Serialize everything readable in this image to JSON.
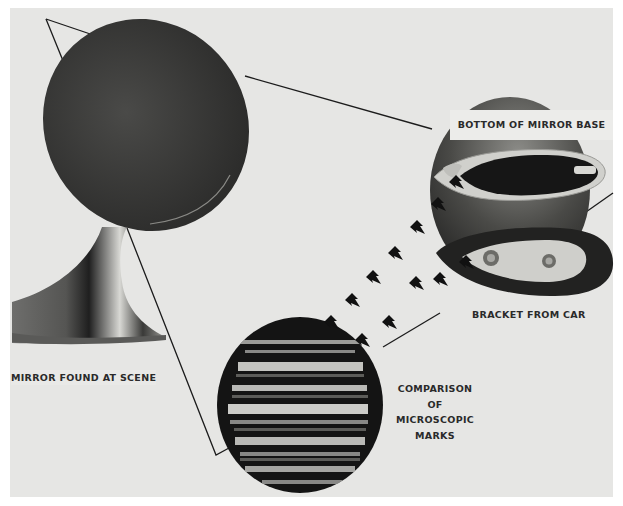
{
  "figure": {
    "background_color": "#e6e6e4",
    "ink_color": "#1c1c1c",
    "labels": {
      "bottom_of_mirror_base": "BOTTOM OF MIRROR BASE",
      "bracket_from_car": "BRACKET FROM CAR",
      "mirror_found_at_scene": "MIRROR FOUND AT SCENE",
      "comparison": [
        "COMPARISON",
        "OF",
        "MICROSCOPIC",
        "MARKS"
      ]
    },
    "elements": {
      "mirror": "mirror-found-at-scene-photo",
      "mirror_base": "bottom-of-mirror-base-photo",
      "bracket": "bracket-from-car-photo",
      "micrograph": "microscopic-marks-comparison-circle",
      "arrows": "arrow-icon",
      "arrow_count": 12
    }
  }
}
